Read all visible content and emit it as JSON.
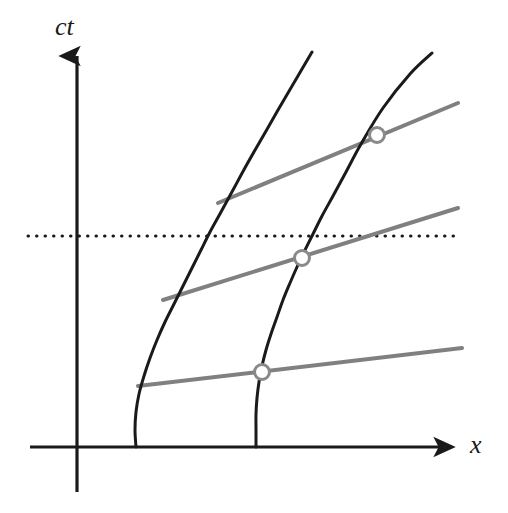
{
  "figure": {
    "kind": "minkowski-spacetime-diagram",
    "width": 508,
    "height": 513,
    "background": "#ffffff"
  },
  "axes": {
    "vertical": {
      "label": "ct",
      "name": "ct-axis",
      "color": "#1a1a1a",
      "x": 77,
      "top": 50,
      "bottom": 492,
      "arrow": "up",
      "stroke_width": 3.2
    },
    "horizontal": {
      "label": "x",
      "name": "x-axis",
      "color": "#1a1a1a",
      "y": 447,
      "left": 30,
      "right": 458,
      "arrow": "right",
      "stroke_width": 3.2
    },
    "origin": {
      "x": 77,
      "y": 447
    }
  },
  "dotted_line": {
    "name": "constant-time-dotted-line",
    "color": "#1a1a1a",
    "y": 236,
    "x_start": 28,
    "x_end": 460,
    "dash": "3 8",
    "stroke_width": 3
  },
  "colors": {
    "worldline": "#1a1a1a",
    "simultaneity": "#808080",
    "marker_stroke": "#8a8a8a",
    "marker_fill": "#ffffff",
    "axis": "#1a1a1a"
  },
  "chart_data": {
    "type": "line",
    "title": "",
    "xlabel": "x",
    "ylabel": "ct",
    "grid": false,
    "legend": null,
    "worldlines": [
      {
        "name": "inner-hyperbola",
        "style": "solid-black-curve",
        "color": "#1a1a1a",
        "stroke_width": 3,
        "points": [
          [
            136,
            447
          ],
          [
            135,
            430
          ],
          [
            136,
            412
          ],
          [
            139,
            394
          ],
          [
            144,
            376
          ],
          [
            150,
            358
          ],
          [
            157,
            340
          ],
          [
            165,
            322
          ],
          [
            174,
            304
          ],
          [
            183,
            286
          ],
          [
            192,
            268
          ],
          [
            201,
            250
          ],
          [
            210,
            232
          ],
          [
            221,
            212
          ],
          [
            233,
            190
          ],
          [
            246,
            166
          ],
          [
            262,
            138
          ],
          [
            278,
            110
          ],
          [
            295,
            81
          ],
          [
            312,
            52
          ]
        ]
      },
      {
        "name": "outer-hyperbola",
        "style": "solid-black-curve",
        "color": "#1a1a1a",
        "stroke_width": 3,
        "points": [
          [
            256,
            447
          ],
          [
            256,
            430
          ],
          [
            256,
            414
          ],
          [
            257,
            398
          ],
          [
            259,
            382
          ],
          [
            262,
            366
          ],
          [
            266,
            350
          ],
          [
            271,
            334
          ],
          [
            277,
            317
          ],
          [
            283,
            300
          ],
          [
            290,
            283
          ],
          [
            297,
            267
          ],
          [
            305,
            250
          ],
          [
            313,
            234
          ],
          [
            322,
            216
          ],
          [
            333,
            196
          ],
          [
            346,
            172
          ],
          [
            361,
            144
          ],
          [
            383,
            108
          ],
          [
            410,
            74
          ],
          [
            432,
            53
          ]
        ]
      }
    ],
    "simultaneity_lines": [
      {
        "name": "upper-simultaneity-line",
        "color": "#808080",
        "stroke_width": 4,
        "x1": 218,
        "y1": 203,
        "x2": 458,
        "y2": 103
      },
      {
        "name": "middle-simultaneity-line",
        "color": "#808080",
        "stroke_width": 4,
        "x1": 163,
        "y1": 300,
        "x2": 458,
        "y2": 208
      },
      {
        "name": "lower-simultaneity-line",
        "color": "#808080",
        "stroke_width": 4,
        "x1": 138,
        "y1": 386,
        "x2": 462,
        "y2": 348
      }
    ],
    "intersection_markers": [
      {
        "name": "upper-event-marker",
        "cx": 377,
        "cy": 135,
        "r": 7.5
      },
      {
        "name": "middle-event-marker",
        "cx": 302,
        "cy": 258,
        "r": 7.5
      },
      {
        "name": "lower-event-marker",
        "cx": 262,
        "cy": 372,
        "r": 7.5
      }
    ]
  }
}
